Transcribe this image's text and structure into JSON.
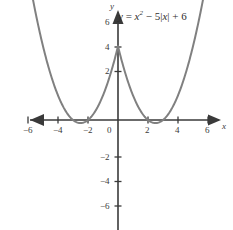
{
  "figure": {
    "name": "function-graph",
    "equation_label": "y = x² − 5|x| + 6",
    "equation_parts": {
      "lhs": "y",
      "equals": "=",
      "var": "x",
      "exponent": "2",
      "minus": "− 5|",
      "var2": "x",
      "tail": "| + 6"
    },
    "x_axis_name": "x",
    "y_axis_name": "y",
    "curve_color": "#808080",
    "axis_color": "#3a3a3a",
    "background_color": "#ffffff"
  },
  "chart_data": {
    "type": "line",
    "title": "",
    "subtitle": "",
    "xlabel": "x",
    "ylabel": "y",
    "annotations": [
      "y = x² − 5|x| + 6"
    ],
    "legend": [],
    "legend_position": "none",
    "grid": false,
    "xlim": [
      -7,
      7
    ],
    "ylim": [
      -7,
      7
    ],
    "xticks": [
      -6,
      -4,
      -2,
      0,
      2,
      4,
      6
    ],
    "xtick_labels": [
      "−6",
      "−4",
      "−2",
      "0",
      "2",
      "4",
      "6"
    ],
    "yticks": [
      6,
      4,
      2,
      -2,
      -4,
      -6
    ],
    "ytick_labels": [
      "6",
      "4",
      "2",
      "−2",
      "−4",
      "−6"
    ],
    "origin_label": "0",
    "series": [
      {
        "name": "y = x² − 5|x| + 6",
        "color": "#808080",
        "x": [
          -5.6,
          -5.2,
          -4.8,
          -4.4,
          -4.0,
          -3.6,
          -3.2,
          -3.0,
          -2.8,
          -2.5,
          -2.2,
          -2.0,
          -1.6,
          -1.2,
          -0.8,
          -0.4,
          0.0,
          0.4,
          0.8,
          1.2,
          1.6,
          2.0,
          2.2,
          2.5,
          2.8,
          3.0,
          3.2,
          3.6,
          4.0,
          4.4,
          4.8,
          5.2,
          5.6
        ],
        "y": [
          9.36,
          7.04,
          5.04,
          3.36,
          2.0,
          0.96,
          0.24,
          0.0,
          -0.16,
          -0.25,
          -0.16,
          0.0,
          0.56,
          1.44,
          2.64,
          4.16,
          6.0,
          4.16,
          2.64,
          1.44,
          0.56,
          0.0,
          -0.16,
          -0.25,
          -0.16,
          0.0,
          0.24,
          0.96,
          2.0,
          3.36,
          5.04,
          7.04,
          9.36
        ]
      }
    ],
    "key_points": {
      "vertex_left": [
        -2.5,
        -0.25
      ],
      "vertex_right": [
        2.5,
        -0.25
      ],
      "cusp": [
        0,
        6
      ],
      "roots": [
        -3,
        -2,
        2,
        3
      ]
    }
  }
}
